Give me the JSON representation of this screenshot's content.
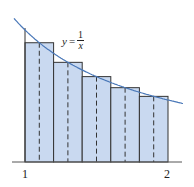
{
  "figure": {
    "equation": {
      "lhs": "y",
      "eq": "=",
      "numerator": "1",
      "denominator": "x"
    },
    "x_labels": {
      "left": "1",
      "right": "2"
    },
    "colors": {
      "curve": "#4a78b8",
      "rect_fill": "#c9d9f0",
      "rect_stroke": "#333333",
      "axis": "#555555"
    }
  },
  "chart_data": {
    "type": "area",
    "function": "1/x",
    "x_range": [
      1,
      2
    ],
    "method": "midpoint rule",
    "n_rectangles": 5,
    "rectangles": [
      {
        "left": 1.0,
        "right": 1.2,
        "midpoint": 1.1,
        "height": 0.909
      },
      {
        "left": 1.2,
        "right": 1.4,
        "midpoint": 1.3,
        "height": 0.769
      },
      {
        "left": 1.4,
        "right": 1.6,
        "midpoint": 1.5,
        "height": 0.667
      },
      {
        "left": 1.6,
        "right": 1.8,
        "midpoint": 1.7,
        "height": 0.588
      },
      {
        "left": 1.8,
        "right": 2.0,
        "midpoint": 1.9,
        "height": 0.526
      }
    ],
    "tick_labels": [
      "1",
      "2"
    ],
    "xlabel": "",
    "ylabel": ""
  }
}
